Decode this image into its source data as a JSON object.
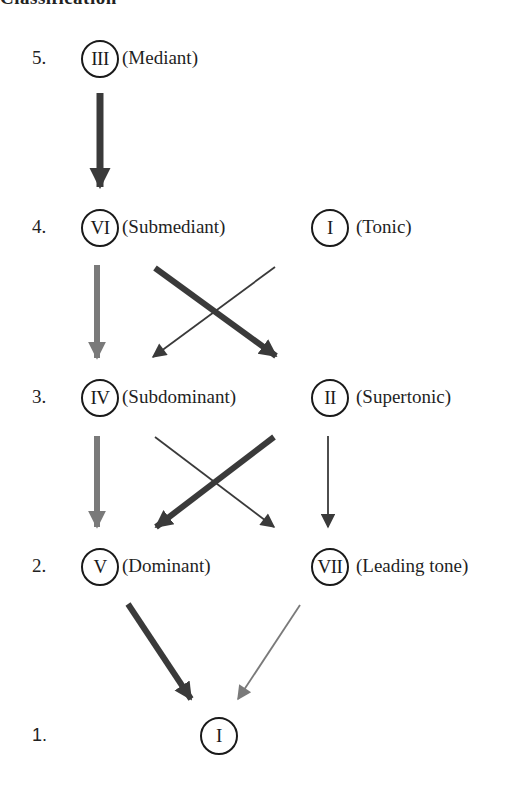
{
  "heading": {
    "text": "Classification"
  },
  "levels": [
    {
      "number": "5.",
      "nodes": [
        {
          "numeral": "III",
          "name": "(Mediant)"
        }
      ]
    },
    {
      "number": "4.",
      "nodes": [
        {
          "numeral": "VI",
          "name": "(Submediant)"
        },
        {
          "numeral": "I",
          "name": "(Tonic)"
        }
      ]
    },
    {
      "number": "3.",
      "nodes": [
        {
          "numeral": "IV",
          "name": "(Subdominant)"
        },
        {
          "numeral": "II",
          "name": "(Supertonic)"
        }
      ]
    },
    {
      "number": "2.",
      "nodes": [
        {
          "numeral": "V",
          "name": "(Dominant)"
        },
        {
          "numeral": "VII",
          "name": "(Leading tone)"
        }
      ]
    },
    {
      "number": "1.",
      "nodes": [
        {
          "numeral": "I",
          "name": ""
        }
      ]
    }
  ],
  "edges": [
    {
      "from": "III",
      "to": "VI",
      "weight": "thick",
      "color": "#3a3a3a"
    },
    {
      "from": "VI",
      "to": "IV",
      "weight": "medium",
      "color": "#7a7a7a"
    },
    {
      "from": "VI",
      "to": "II",
      "weight": "thick",
      "color": "#3a3a3a"
    },
    {
      "from": "I",
      "to": "IV",
      "weight": "thin",
      "color": "#3a3a3a"
    },
    {
      "from": "IV",
      "to": "V",
      "weight": "medium",
      "color": "#7a7a7a"
    },
    {
      "from": "IV",
      "to": "VII",
      "weight": "thin",
      "color": "#3a3a3a"
    },
    {
      "from": "II",
      "to": "V",
      "weight": "thick",
      "color": "#3a3a3a"
    },
    {
      "from": "II",
      "to": "VII",
      "weight": "thin",
      "color": "#3a3a3a"
    },
    {
      "from": "V",
      "to": "I",
      "weight": "thick",
      "color": "#3a3a3a"
    },
    {
      "from": "VII",
      "to": "I",
      "weight": "thin",
      "color": "#7a7a7a"
    }
  ],
  "colors": {
    "dark": "#3a3a3a",
    "gray": "#7a7a7a",
    "ink": "#1a1a1a"
  }
}
